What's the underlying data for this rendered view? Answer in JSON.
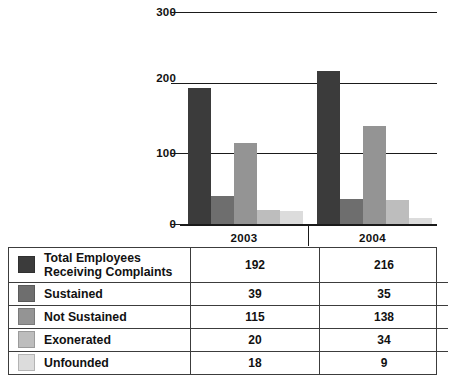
{
  "chart_data": {
    "type": "bar",
    "title": "",
    "xlabel": "",
    "ylabel": "",
    "categories": [
      "2003",
      "2004"
    ],
    "ylim": [
      0,
      300
    ],
    "yticks": [
      0,
      100,
      200,
      300
    ],
    "ytick_labels": [
      "0",
      "100",
      "200",
      "300"
    ],
    "grid": true,
    "legend_position": "table-below",
    "series": [
      {
        "name": "Total Employees Receiving Complaints",
        "values": [
          192,
          216
        ],
        "color": "#3b3b3b"
      },
      {
        "name": "Sustained",
        "values": [
          39,
          35
        ],
        "color": "#6e6e6e"
      },
      {
        "name": "Not Sustained",
        "values": [
          115,
          138
        ],
        "color": "#949494"
      },
      {
        "name": "Exonerated",
        "values": [
          20,
          34
        ],
        "color": "#bdbdbd"
      },
      {
        "name": "Unfounded",
        "values": [
          18,
          9
        ],
        "color": "#dcdcdc"
      }
    ]
  },
  "table": {
    "column_headers": [
      "2003",
      "2004"
    ],
    "rows": [
      {
        "label": "Total Employees\nReceiving Complaints",
        "swatch": "#3b3b3b",
        "v2003": "192",
        "v2004": "216"
      },
      {
        "label": "Sustained",
        "swatch": "#6e6e6e",
        "v2003": "39",
        "v2004": "35"
      },
      {
        "label": "Not Sustained",
        "swatch": "#949494",
        "v2003": "115",
        "v2004": "138"
      },
      {
        "label": "Exonerated",
        "swatch": "#bdbdbd",
        "v2003": "20",
        "v2004": "34"
      },
      {
        "label": "Unfounded",
        "swatch": "#dcdcdc",
        "v2003": "18",
        "v2004": "9"
      }
    ]
  },
  "axis": {
    "tick_300": "300",
    "tick_200": "200",
    "tick_100": "100",
    "tick_0": "0"
  },
  "categories": {
    "cat_0": "2003",
    "cat_1": "2004"
  }
}
